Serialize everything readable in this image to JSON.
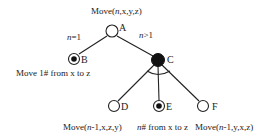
{
  "diagram": {
    "type": "and-or-tree",
    "title": "Move(n,x,y,z)",
    "nodes": [
      {
        "id": "A",
        "label": "A",
        "style": "open",
        "x": 112,
        "y": 32
      },
      {
        "id": "B",
        "label": "B",
        "style": "terminal",
        "x": 74,
        "y": 58,
        "caption": "Move 1# from x to z"
      },
      {
        "id": "C",
        "label": "C",
        "style": "filled",
        "x": 158,
        "y": 60
      },
      {
        "id": "D",
        "label": "D",
        "style": "open",
        "x": 114,
        "y": 106,
        "caption": "Move(n-1,x,z,y)"
      },
      {
        "id": "E",
        "label": "E",
        "style": "terminal",
        "x": 159,
        "y": 106,
        "caption": "n# from x to z"
      },
      {
        "id": "F",
        "label": "F",
        "style": "open",
        "x": 203,
        "y": 106,
        "caption": "Move(n-1,y,x,z)"
      }
    ],
    "edges": [
      {
        "from": "A",
        "to": "B",
        "label": "n=1"
      },
      {
        "from": "A",
        "to": "C",
        "label": "n>1"
      },
      {
        "from": "C",
        "to": "D"
      },
      {
        "from": "C",
        "to": "E"
      },
      {
        "from": "C",
        "to": "F"
      }
    ],
    "and_arc_node": "C"
  },
  "text": {
    "title_prefix": "Move(",
    "title_n": "n",
    "title_suffix": ",x,y,z)",
    "edge_ab_n": "n",
    "edge_ab_rest": "=1",
    "edge_ac_n": "n",
    "edge_ac_rest": ">1",
    "node_a": "A",
    "node_b": "B",
    "node_c": "C",
    "node_d": "D",
    "node_e": "E",
    "node_f": "F",
    "caption_b": "Move 1# from x to z",
    "caption_d_prefix": "Move(",
    "caption_d_n": "n",
    "caption_d_suffix": "-1,x,z,y)",
    "caption_e_n": "n",
    "caption_e_suffix": "# from x to z",
    "caption_f_prefix": "Move(",
    "caption_f_n": "n",
    "caption_f_suffix": "-1,y,x,z)"
  }
}
